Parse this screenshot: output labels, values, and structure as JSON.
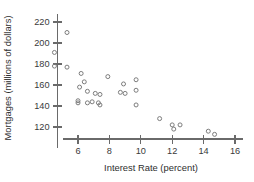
{
  "chart_data": {
    "type": "scatter",
    "title": "",
    "xlabel": "Interest Rate (percent)",
    "ylabel": "Mortgages (millions of dollars)",
    "xlim": [
      4.2,
      16.6
    ],
    "ylim": [
      112,
      226
    ],
    "xticks": [
      6,
      8,
      10,
      12,
      14,
      16
    ],
    "yticks": [
      120,
      140,
      160,
      180,
      200,
      220
    ],
    "xtick_labels": [
      "6",
      "8",
      "10",
      "12",
      "14",
      "16"
    ],
    "ytick_labels": [
      "120",
      "140",
      "160",
      "180",
      "200",
      "220"
    ],
    "grid": false,
    "legend": null,
    "marker": "open-circle",
    "marker_color": "#7c7c7c",
    "points": [
      {
        "x": 5.3,
        "y": 210
      },
      {
        "x": 4.5,
        "y": 191
      },
      {
        "x": 4.5,
        "y": 178
      },
      {
        "x": 5.3,
        "y": 177
      },
      {
        "x": 6.2,
        "y": 171
      },
      {
        "x": 6.4,
        "y": 163
      },
      {
        "x": 6.1,
        "y": 158
      },
      {
        "x": 6.6,
        "y": 154
      },
      {
        "x": 7.1,
        "y": 152
      },
      {
        "x": 7.4,
        "y": 151
      },
      {
        "x": 6.0,
        "y": 145
      },
      {
        "x": 6.0,
        "y": 143
      },
      {
        "x": 6.6,
        "y": 143
      },
      {
        "x": 6.9,
        "y": 144
      },
      {
        "x": 7.3,
        "y": 143
      },
      {
        "x": 7.4,
        "y": 141
      },
      {
        "x": 7.9,
        "y": 168
      },
      {
        "x": 8.9,
        "y": 161
      },
      {
        "x": 8.7,
        "y": 153
      },
      {
        "x": 9.0,
        "y": 152
      },
      {
        "x": 9.7,
        "y": 165
      },
      {
        "x": 9.7,
        "y": 155
      },
      {
        "x": 9.7,
        "y": 141
      },
      {
        "x": 11.2,
        "y": 128
      },
      {
        "x": 12.0,
        "y": 122
      },
      {
        "x": 12.1,
        "y": 118
      },
      {
        "x": 12.5,
        "y": 122
      },
      {
        "x": 14.3,
        "y": 116
      },
      {
        "x": 14.7,
        "y": 113
      }
    ]
  },
  "axes": {
    "x_axis_name": "x-axis",
    "y_axis_name": "y-axis"
  }
}
